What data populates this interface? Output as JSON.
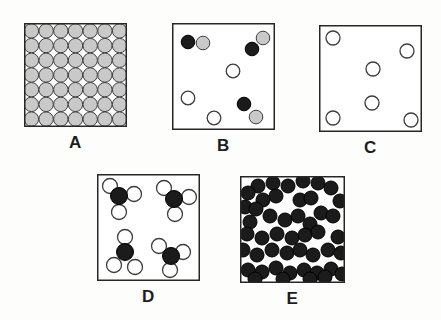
{
  "colors": {
    "particle_gray": "#c9c9c9",
    "particle_black": "#1b1b1b",
    "particle_white": "#ffffff",
    "outline": "#3d3d3d",
    "black_outline": "#000000",
    "box_border": "#262626",
    "label_text": "#1d1d1d"
  },
  "panels": {
    "A": {
      "label": "A",
      "box": {
        "w": 103,
        "h": 104
      },
      "particles": [
        [
          7.4,
          7.9,
          7.2,
          "gray"
        ],
        [
          22.1,
          7.9,
          7.2,
          "gray"
        ],
        [
          36.8,
          7.9,
          7.2,
          "gray"
        ],
        [
          51.5,
          7.9,
          7.2,
          "gray"
        ],
        [
          66.2,
          7.9,
          7.2,
          "gray"
        ],
        [
          80.9,
          7.9,
          7.2,
          "gray"
        ],
        [
          95.6,
          7.9,
          7.2,
          "gray"
        ],
        [
          7.4,
          22.6,
          7.2,
          "gray"
        ],
        [
          22.1,
          22.6,
          7.2,
          "gray"
        ],
        [
          36.8,
          22.6,
          7.2,
          "gray"
        ],
        [
          51.5,
          22.6,
          7.2,
          "gray"
        ],
        [
          66.2,
          22.6,
          7.2,
          "gray"
        ],
        [
          80.9,
          22.6,
          7.2,
          "gray"
        ],
        [
          95.6,
          22.6,
          7.2,
          "gray"
        ],
        [
          7.4,
          37.3,
          7.2,
          "gray"
        ],
        [
          22.1,
          37.3,
          7.2,
          "gray"
        ],
        [
          36.8,
          37.3,
          7.2,
          "gray"
        ],
        [
          51.5,
          37.3,
          7.2,
          "gray"
        ],
        [
          66.2,
          37.3,
          7.2,
          "gray"
        ],
        [
          80.9,
          37.3,
          7.2,
          "gray"
        ],
        [
          95.6,
          37.3,
          7.2,
          "gray"
        ],
        [
          7.4,
          52.0,
          7.2,
          "gray"
        ],
        [
          22.1,
          52.0,
          7.2,
          "gray"
        ],
        [
          36.8,
          52.0,
          7.2,
          "gray"
        ],
        [
          51.5,
          52.0,
          7.2,
          "gray"
        ],
        [
          66.2,
          52.0,
          7.2,
          "gray"
        ],
        [
          80.9,
          52.0,
          7.2,
          "gray"
        ],
        [
          95.6,
          52.0,
          7.2,
          "gray"
        ],
        [
          7.4,
          66.7,
          7.2,
          "gray"
        ],
        [
          22.1,
          66.7,
          7.2,
          "gray"
        ],
        [
          36.8,
          66.7,
          7.2,
          "gray"
        ],
        [
          51.5,
          66.7,
          7.2,
          "gray"
        ],
        [
          66.2,
          66.7,
          7.2,
          "gray"
        ],
        [
          80.9,
          66.7,
          7.2,
          "gray"
        ],
        [
          95.6,
          66.7,
          7.2,
          "gray"
        ],
        [
          7.4,
          81.4,
          7.2,
          "gray"
        ],
        [
          22.1,
          81.4,
          7.2,
          "gray"
        ],
        [
          36.8,
          81.4,
          7.2,
          "gray"
        ],
        [
          51.5,
          81.4,
          7.2,
          "gray"
        ],
        [
          66.2,
          81.4,
          7.2,
          "gray"
        ],
        [
          80.9,
          81.4,
          7.2,
          "gray"
        ],
        [
          95.6,
          81.4,
          7.2,
          "gray"
        ],
        [
          7.4,
          96.1,
          7.2,
          "gray"
        ],
        [
          22.1,
          96.1,
          7.2,
          "gray"
        ],
        [
          36.8,
          96.1,
          7.2,
          "gray"
        ],
        [
          51.5,
          96.1,
          7.2,
          "gray"
        ],
        [
          66.2,
          96.1,
          7.2,
          "gray"
        ],
        [
          80.9,
          96.1,
          7.2,
          "gray"
        ],
        [
          95.6,
          96.1,
          7.2,
          "gray"
        ]
      ]
    },
    "B": {
      "label": "B",
      "box": {
        "w": 103,
        "h": 107
      },
      "particles": [
        [
          31,
          20,
          6.8,
          "gray"
        ],
        [
          16,
          19,
          6.8,
          "black"
        ],
        [
          91,
          15,
          6.8,
          "gray"
        ],
        [
          80,
          26,
          6.8,
          "black"
        ],
        [
          84,
          94,
          6.8,
          "gray"
        ],
        [
          72,
          81,
          6.8,
          "black"
        ],
        [
          61,
          48,
          6.8,
          "white"
        ],
        [
          16,
          75,
          6.8,
          "white"
        ],
        [
          42,
          95,
          6.8,
          "white"
        ]
      ]
    },
    "C": {
      "label": "C",
      "box": {
        "w": 103,
        "h": 107
      },
      "particles": [
        [
          14,
          13,
          7,
          "white"
        ],
        [
          88,
          26,
          7,
          "white"
        ],
        [
          54,
          44,
          7,
          "white"
        ],
        [
          53,
          78,
          7,
          "white"
        ],
        [
          14,
          93,
          7,
          "white"
        ],
        [
          92,
          95,
          7,
          "white"
        ]
      ]
    },
    "D": {
      "label": "D",
      "box": {
        "w": 103,
        "h": 107
      },
      "particles": [
        [
          13,
          12,
          7.5,
          "white"
        ],
        [
          37,
          20,
          7.5,
          "white"
        ],
        [
          22,
          38,
          7.5,
          "white"
        ],
        [
          22,
          22,
          8.5,
          "black"
        ],
        [
          67,
          14,
          7.5,
          "white"
        ],
        [
          92,
          23,
          7.5,
          "white"
        ],
        [
          78,
          40,
          7.5,
          "white"
        ],
        [
          77,
          25,
          8.5,
          "black"
        ],
        [
          28,
          63,
          7.5,
          "white"
        ],
        [
          17,
          91,
          7.5,
          "white"
        ],
        [
          38,
          93,
          7.5,
          "white"
        ],
        [
          28,
          78,
          8.5,
          "black"
        ],
        [
          62,
          72,
          7.5,
          "white"
        ],
        [
          86,
          78,
          7.5,
          "white"
        ],
        [
          73,
          96,
          7.5,
          "white"
        ],
        [
          74,
          82,
          8.5,
          "black"
        ]
      ]
    },
    "E": {
      "label": "E",
      "box": {
        "w": 105,
        "h": 107
      },
      "particles": [
        [
          18,
          10,
          7,
          "black"
        ],
        [
          33,
          7,
          7,
          "black"
        ],
        [
          48,
          10,
          7,
          "black"
        ],
        [
          63,
          5,
          7,
          "black"
        ],
        [
          78,
          7,
          7,
          "black"
        ],
        [
          91,
          12,
          7,
          "black"
        ],
        [
          8,
          17,
          7,
          "black"
        ],
        [
          23,
          24,
          7,
          "black"
        ],
        [
          36,
          20,
          7,
          "black"
        ],
        [
          60,
          24,
          7,
          "black"
        ],
        [
          71,
          22,
          7,
          "black"
        ],
        [
          100,
          25,
          7,
          "black"
        ],
        [
          5,
          31,
          7,
          "black"
        ],
        [
          16,
          33,
          7,
          "black"
        ],
        [
          30,
          40,
          7,
          "black"
        ],
        [
          45,
          44,
          7,
          "black"
        ],
        [
          58,
          40,
          7,
          "black"
        ],
        [
          81,
          37,
          7,
          "black"
        ],
        [
          93,
          40,
          7,
          "black"
        ],
        [
          10,
          46,
          7,
          "black"
        ],
        [
          70,
          48,
          7,
          "black"
        ],
        [
          22,
          62,
          7,
          "black"
        ],
        [
          37,
          58,
          7,
          "black"
        ],
        [
          52,
          62,
          7,
          "black"
        ],
        [
          65,
          59,
          7,
          "black"
        ],
        [
          78,
          56,
          7,
          "black"
        ],
        [
          98,
          61,
          7,
          "black"
        ],
        [
          7,
          58,
          7,
          "black"
        ],
        [
          17,
          79,
          7,
          "black"
        ],
        [
          32,
          74,
          7,
          "black"
        ],
        [
          47,
          77,
          7,
          "black"
        ],
        [
          60,
          74,
          7,
          "black"
        ],
        [
          73,
          79,
          7,
          "black"
        ],
        [
          88,
          74,
          7,
          "black"
        ],
        [
          101,
          77,
          7,
          "black"
        ],
        [
          3,
          74,
          7,
          "black"
        ],
        [
          8,
          94,
          7,
          "black"
        ],
        [
          22,
          96,
          7,
          "black"
        ],
        [
          36,
          92,
          7,
          "black"
        ],
        [
          50,
          97,
          7,
          "black"
        ],
        [
          64,
          94,
          7,
          "black"
        ],
        [
          77,
          97,
          7,
          "black"
        ],
        [
          91,
          93,
          7,
          "black"
        ],
        [
          102,
          98,
          7,
          "black"
        ],
        [
          15,
          103,
          7,
          "black"
        ],
        [
          43,
          103,
          7,
          "black"
        ],
        [
          70,
          103,
          7,
          "black"
        ],
        [
          85,
          101,
          7,
          "black"
        ]
      ]
    }
  }
}
